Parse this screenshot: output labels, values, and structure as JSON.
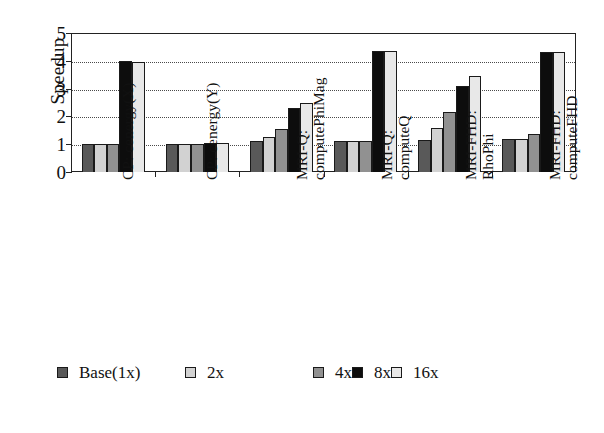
{
  "chart_data": {
    "type": "bar",
    "title": "",
    "xlabel": "",
    "ylabel": "Speedup",
    "ylim": [
      0,
      5
    ],
    "yticks": [
      0,
      1,
      2,
      3,
      4,
      5
    ],
    "grid": true,
    "grid_style": "dotted-horizontal",
    "legend_position": "bottom-left",
    "categories": [
      "CP: cenergy(X)",
      "CP: cenergy(Y)",
      "MRI-Q: computePhiMag",
      "MRI-Q: computeQ",
      "MRI-FHD: RhoPhi",
      "MRI-FHD: computeFHD"
    ],
    "category_lines": [
      [
        "CP: cenergy(X)",
        ""
      ],
      [
        "CP: cenergy(Y)",
        ""
      ],
      [
        "MRI-Q:",
        "computePhiMag"
      ],
      [
        "MRI-Q:",
        "computeQ"
      ],
      [
        "MRI-FHD:",
        "RhoPhi"
      ],
      [
        "MRI-FHD:",
        "computeFHD"
      ]
    ],
    "series": [
      {
        "name": "Base(1x)",
        "color": "#595959",
        "values": [
          1.0,
          1.02,
          1.1,
          1.1,
          1.15,
          1.2
        ]
      },
      {
        "name": "2x",
        "color": "#d2d2d2",
        "values": [
          1.0,
          1.02,
          1.25,
          1.1,
          1.6,
          1.2
        ]
      },
      {
        "name": "4x",
        "color": "#919191",
        "values": [
          1.0,
          1.02,
          1.55,
          1.1,
          2.15,
          1.35
        ]
      },
      {
        "name": "8x",
        "color": "#0d0d0d",
        "values": [
          4.0,
          1.05,
          2.3,
          4.35,
          3.1,
          4.3
        ]
      },
      {
        "name": "16x",
        "color": "#e8e8e8",
        "values": [
          3.95,
          1.03,
          2.5,
          4.35,
          3.45,
          4.3
        ]
      }
    ]
  },
  "legend": {
    "items": [
      {
        "label": "Base(1x)",
        "color": "#595959"
      },
      {
        "label": "2x",
        "color": "#d2d2d2"
      },
      {
        "label": "4x",
        "color": "#919191"
      },
      {
        "label": "8x",
        "color": "#0d0d0d"
      },
      {
        "label": "16x",
        "color": "#e8e8e8"
      }
    ]
  }
}
